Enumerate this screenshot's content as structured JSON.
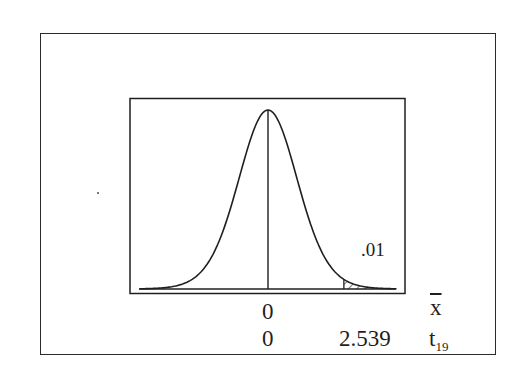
{
  "chart_data": {
    "type": "line",
    "title": "",
    "distribution": "t",
    "degrees_of_freedom": 19,
    "center": 0,
    "critical_value": 2.539,
    "tail_area": 0.01,
    "tail": "right",
    "shaded_region": {
      "from": 2.539,
      "to": "inf",
      "pattern": "hatched"
    },
    "annotations": [
      {
        "text": ".01",
        "position": "above right tail"
      }
    ],
    "axes": [
      {
        "name": "x-bar",
        "label": "x̄",
        "ticks": [
          {
            "value": 0,
            "label": "0"
          }
        ]
      },
      {
        "name": "t19",
        "label": "t19",
        "ticks": [
          {
            "value": 0,
            "label": "0"
          },
          {
            "value": 2.539,
            "label": "2.539"
          }
        ]
      }
    ],
    "xlim": [
      -4.3,
      4.3
    ],
    "grid": false,
    "legend": null
  },
  "labels": {
    "tail_area": ".01",
    "xbar_tick_zero": "0",
    "xbar_axis": "x",
    "t_tick_zero": "0",
    "t_tick_critical": "2.539",
    "t_axis_base": "t",
    "t_axis_sub": "19"
  },
  "colors": {
    "ink": "#1f1f1f",
    "background": "#ffffff"
  }
}
